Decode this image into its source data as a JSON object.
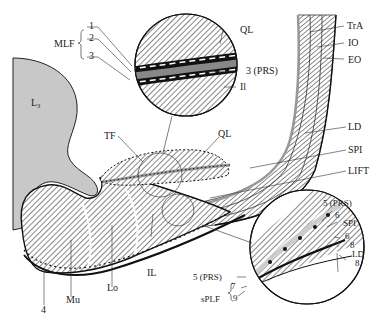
{
  "diagram": {
    "type": "anatomical-cross-section",
    "colors": {
      "bone": "#c8c8c8",
      "muscle_hatch": "#555555",
      "fascia_gray": "#999999",
      "outline": "#111111",
      "background": "#ffffff"
    },
    "labels": {
      "mlf": "MLF",
      "mlf_1": "1",
      "mlf_2": "2",
      "mlf_3": "3",
      "ql_top": "QL",
      "prs_3": "3 (PRS)",
      "il_top": "Il",
      "tra": "TrA",
      "io": "IO",
      "eo": "EO",
      "l3": "L₃",
      "tf": "TF",
      "ql_mid": "QL",
      "ld": "LD",
      "spi": "SPI",
      "lift": "LIFT",
      "il": "IL",
      "lo": "Lo",
      "mu": "Mu",
      "four": "4",
      "prs_5_top": "5 (PRS)",
      "six_a": "6",
      "spi_inset": "SPI",
      "six_b": "6",
      "eight_a": "8",
      "ld_inset": "LD",
      "eight_b": "8",
      "prs_5_left": "5 (PRS)",
      "seven": "7",
      "nine": "9",
      "splf": "sPLF"
    }
  }
}
